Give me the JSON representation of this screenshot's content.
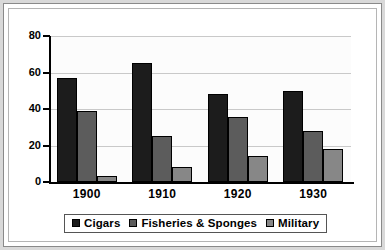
{
  "chart_data": {
    "type": "bar",
    "title": "",
    "xlabel": "",
    "ylabel": "",
    "ylim": [
      0,
      80
    ],
    "yticks": [
      0,
      20,
      40,
      60,
      80
    ],
    "ytick_labels": [
      "0",
      "20",
      "40",
      "60",
      "80"
    ],
    "grid": true,
    "legend_position": "bottom",
    "categories": [
      "1900",
      "1910",
      "1920",
      "1930"
    ],
    "series": [
      {
        "name": "Cigars",
        "color": "#1c1c1c",
        "values": [
          57,
          65,
          48.5,
          50
        ]
      },
      {
        "name": "Fisheries  & Sponges",
        "color": "#5c5c5c",
        "values": [
          39,
          25,
          35.5,
          28
        ]
      },
      {
        "name": "Military",
        "color": "#878787",
        "values": [
          3.5,
          8,
          14,
          18
        ]
      }
    ]
  },
  "legend": {
    "entries": [
      {
        "label": "Cigars"
      },
      {
        "label": "Fisheries  & Sponges"
      },
      {
        "label": "Military"
      }
    ]
  }
}
